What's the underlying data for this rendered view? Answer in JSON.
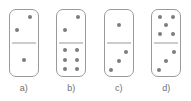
{
  "figure": {
    "title": "",
    "background_color": "#ffffff",
    "tile_outline_color": "#9a9a9a",
    "pip_color": "#7d7d7d",
    "label_color": "#6f6f6f",
    "tiles": [
      {
        "label": "a)",
        "name": "domino-tile-a",
        "top_value": 2,
        "bottom_value": 1,
        "notation": "2|1",
        "top_pips": [
          {
            "x": 73,
            "y": 22
          },
          {
            "x": 27,
            "y": 62
          }
        ],
        "bottom_pips": [
          {
            "x": 50,
            "y": 50
          }
        ]
      },
      {
        "label": "b)",
        "name": "domino-tile-b",
        "top_value": 2,
        "bottom_value": 6,
        "notation": "2|6",
        "top_pips": [
          {
            "x": 73,
            "y": 22
          },
          {
            "x": 27,
            "y": 62
          }
        ],
        "bottom_pips": [
          {
            "x": 28,
            "y": 22
          },
          {
            "x": 72,
            "y": 22
          },
          {
            "x": 28,
            "y": 50
          },
          {
            "x": 72,
            "y": 50
          },
          {
            "x": 28,
            "y": 78
          },
          {
            "x": 72,
            "y": 78
          }
        ]
      },
      {
        "label": "c)",
        "name": "domino-tile-c",
        "top_value": 1,
        "bottom_value": 3,
        "notation": "1|3",
        "top_pips": [
          {
            "x": 50,
            "y": 45
          }
        ],
        "bottom_pips": [
          {
            "x": 76,
            "y": 26
          },
          {
            "x": 50,
            "y": 55
          },
          {
            "x": 24,
            "y": 82
          }
        ]
      },
      {
        "label": "d)",
        "name": "domino-tile-d",
        "top_value": 5,
        "bottom_value": 3,
        "notation": "5|3",
        "top_pips": [
          {
            "x": 27,
            "y": 20
          },
          {
            "x": 73,
            "y": 20
          },
          {
            "x": 50,
            "y": 45
          },
          {
            "x": 27,
            "y": 72
          },
          {
            "x": 73,
            "y": 72
          }
        ],
        "bottom_pips": [
          {
            "x": 76,
            "y": 26
          },
          {
            "x": 50,
            "y": 55
          },
          {
            "x": 24,
            "y": 82
          }
        ]
      }
    ]
  }
}
